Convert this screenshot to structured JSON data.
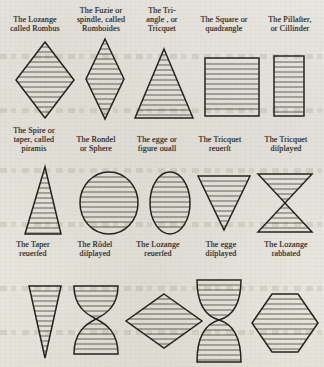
{
  "plate": {
    "title": "Geometrical figures of heraldry",
    "ink_color": "#26231e",
    "paper_color": "#e9e7e0",
    "rows": [
      {
        "row_index": 1,
        "figures": [
          {
            "name": "lozenge",
            "caption_lines": [
              "The  Lozange",
              "called Rombus"
            ],
            "shape": "diamond"
          },
          {
            "name": "fusil",
            "caption_lines": [
              "The Fuzie or",
              "spindle, called",
              "Romboides"
            ],
            "shape": "fusil"
          },
          {
            "name": "triangle",
            "caption_lines": [
              "The Tri-",
              "angle , or",
              "Tricquet"
            ],
            "shape": "triangle"
          },
          {
            "name": "square",
            "caption_lines": [
              "The Square or",
              "quadrangle"
            ],
            "shape": "square"
          },
          {
            "name": "pillaster",
            "caption_lines": [
              "The Pillaſter,",
              "or Cillinder"
            ],
            "shape": "rectangle"
          }
        ]
      },
      {
        "row_index": 2,
        "figures": [
          {
            "name": "spire",
            "caption_lines": [
              "The Spire or",
              "taper, called",
              "piramis"
            ],
            "shape": "spire"
          },
          {
            "name": "roundel",
            "caption_lines": [
              "The Rondel",
              "or Sphere"
            ],
            "shape": "circle"
          },
          {
            "name": "egg",
            "caption_lines": [
              "The egge or",
              "figure ouall"
            ],
            "shape": "oval"
          },
          {
            "name": "triangle-reversed",
            "caption_lines": [
              "The Tricquet",
              "reuerſt"
            ],
            "shape": "triangle-down"
          },
          {
            "name": "triangle-displayed",
            "caption_lines": [
              "The Tricquet",
              "diſplayed"
            ],
            "shape": "hourglass-triangles"
          }
        ]
      },
      {
        "row_index": 3,
        "figures": [
          {
            "name": "taper-reversed",
            "caption_lines": [
              "The Taper",
              "reuerſed"
            ],
            "shape": "spire-down"
          },
          {
            "name": "roundel-displayed",
            "caption_lines": [
              "The Rôdel",
              "diſplayed"
            ],
            "shape": "hourglass-curved"
          },
          {
            "name": "lozenge-reversed",
            "caption_lines": [
              "The Lozange",
              "reuerſed"
            ],
            "shape": "diamond-wide"
          },
          {
            "name": "egg-displayed",
            "caption_lines": [
              "The egge",
              "diſplayed"
            ],
            "shape": "hourglass-eggs"
          },
          {
            "name": "lozenge-rabbated",
            "caption_lines": [
              "The Lozange",
              "rabbated"
            ],
            "shape": "hexagon"
          }
        ]
      }
    ]
  }
}
